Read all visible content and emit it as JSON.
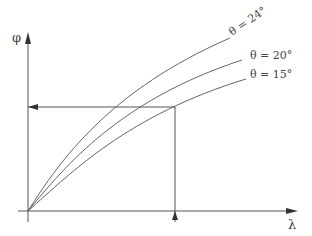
{
  "diagram": {
    "axes": {
      "y_label": "φ",
      "x_label": "λ"
    },
    "curves": [
      {
        "label": "θ = 24°",
        "theta_deg": 24
      },
      {
        "label": "θ = 20°",
        "theta_deg": 20
      },
      {
        "label": "θ = 15°",
        "theta_deg": 15
      }
    ],
    "reading_guide": {
      "description": "Vertical arrow up from λ axis to curves, then horizontal arrow left to φ axis"
    }
  }
}
